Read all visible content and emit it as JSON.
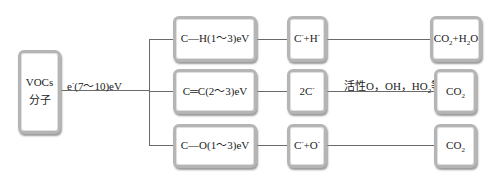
{
  "diagram": {
    "source_box": {
      "line1": "VOCs",
      "line2": "分子"
    },
    "electron_label": {
      "prefix": "e",
      "charge": "-",
      "energy": "(7～10)eV"
    },
    "bonds": [
      {
        "bond": "C—H",
        "energy": "(1～3)eV"
      },
      {
        "bond": "C═C",
        "energy": "(2～3)eV"
      },
      {
        "bond": "C—O",
        "energy": "(1～3)eV"
      }
    ],
    "fragments": [
      {
        "a": "C",
        "a_charge": "-",
        "plus": "+",
        "b": "H",
        "b_charge": "-"
      },
      {
        "a": "2C",
        "a_charge": "-"
      },
      {
        "a": "C",
        "a_charge": "-",
        "plus": "+",
        "b": "O",
        "b_charge": "-"
      }
    ],
    "middle_annotation": {
      "text": "活性O，OH，HO",
      "sub": "2",
      "suffix": "等"
    },
    "products": [
      {
        "p1": "CO",
        "p1_sub": "2",
        "plus": "+",
        "p2": "H",
        "p2_sub": "2",
        "p2_tail": "O"
      },
      {
        "p1": "CO",
        "p1_sub": "2"
      },
      {
        "p1": "CO",
        "p1_sub": "2"
      }
    ]
  }
}
